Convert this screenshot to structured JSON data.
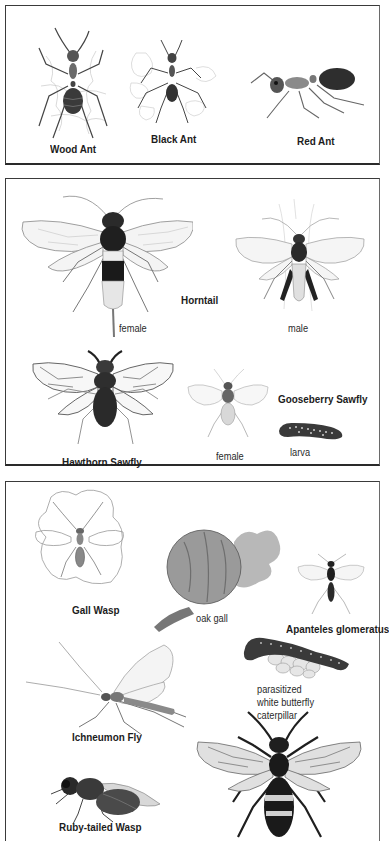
{
  "panels": [
    {
      "name": "ants",
      "items": [
        {
          "label": "Wood Ant"
        },
        {
          "label": "Black Ant"
        },
        {
          "label": "Red Ant"
        }
      ]
    },
    {
      "name": "sawflies",
      "items": [
        {
          "label": "Horntail"
        },
        {
          "label": "female"
        },
        {
          "label": "male"
        },
        {
          "label": "Hawthorn Sawfly"
        },
        {
          "label": "Gooseberry Sawfly"
        },
        {
          "label": "female"
        },
        {
          "label": "larva"
        }
      ]
    },
    {
      "name": "wasps",
      "items": [
        {
          "label": "Gall Wasp"
        },
        {
          "label": "oak gall"
        },
        {
          "label": "Apanteles glomeratus"
        },
        {
          "label_lines": [
            "parasitized",
            "white butterfly",
            "caterpillar"
          ]
        },
        {
          "label": "Ichneumon Fly"
        },
        {
          "label": "Ruby-tailed Wasp"
        }
      ]
    }
  ],
  "colors": {
    "border": "#3a3a3a",
    "ink": "#1c1c1c",
    "background": "#ffffff"
  }
}
